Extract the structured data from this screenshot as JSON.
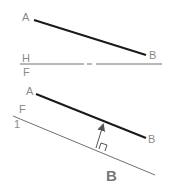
{
  "diagram": {
    "top_view": {
      "line": {
        "start_label": "A",
        "end_label": "B",
        "x1": 34,
        "y1": 20,
        "x2": 146,
        "y2": 55
      }
    },
    "fold_line_1": {
      "upper_label": "H",
      "lower_label": "F",
      "y": 64,
      "x1": 20,
      "x2": 162
    },
    "front_view": {
      "line": {
        "start_label": "A",
        "end_label": "B",
        "x1": 36,
        "y1": 94,
        "x2": 146,
        "y2": 138
      }
    },
    "fold_line_2": {
      "upper_label": "F",
      "lower_label": "1",
      "x1": 13,
      "y1": 116,
      "x2": 155,
      "y2": 175
    },
    "projection_arrow": {
      "x1": 96,
      "y1": 148,
      "x2": 104,
      "y2": 123
    },
    "caption": "B",
    "colors": {
      "object_line": "#1a1a1a",
      "reference_line": "#707070",
      "label": "#8a8a8a"
    }
  }
}
